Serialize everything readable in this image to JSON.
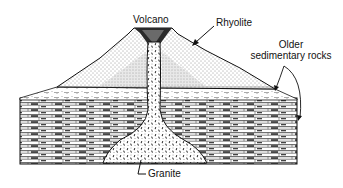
{
  "diagram": {
    "type": "geologic-cross-section"
  },
  "labels": {
    "volcano": "Volcano",
    "rhyolite": "Rhyolite",
    "older_sedimentary_line1": "Older",
    "older_sedimentary_line2": "sedimentary rocks",
    "granite": "Granite"
  },
  "colors": {
    "ink": "#111111",
    "background": "#ffffff",
    "cone_fill": "#f2f2f2",
    "sediment_dark": "#222222"
  }
}
